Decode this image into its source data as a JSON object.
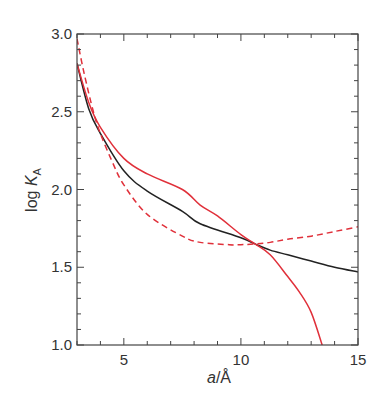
{
  "chart_data": {
    "type": "line",
    "title": "",
    "xlabel": "a/Å",
    "ylabel": "log K_A",
    "xlim": [
      3,
      15
    ],
    "ylim": [
      1.0,
      3.0
    ],
    "xticks": [
      5,
      10,
      15
    ],
    "yticks": [
      1.0,
      1.5,
      2.0,
      2.5,
      3.0
    ],
    "x_minor_step": 1,
    "y_minor_step": 0.1,
    "grid": false,
    "legend": null,
    "series": [
      {
        "name": "black solid",
        "color": "#222222",
        "dash": "solid",
        "x": [
          3.0,
          3.5,
          4.0,
          5.0,
          6.0,
          7.5,
          8.26,
          10.0,
          10.6,
          11.25,
          12.0,
          13.0,
          14.0,
          15.0
        ],
        "y": [
          2.81,
          2.52,
          2.36,
          2.12,
          1.99,
          1.86,
          1.78,
          1.69,
          1.65,
          1.61,
          1.58,
          1.54,
          1.5,
          1.47
        ]
      },
      {
        "name": "red solid",
        "color": "#e0303a",
        "dash": "solid",
        "x": [
          3.0,
          3.5,
          4.0,
          5.0,
          6.0,
          7.5,
          8.26,
          9.0,
          10.0,
          10.6,
          11.25,
          12.0,
          12.5,
          13.0,
          13.47
        ],
        "y": [
          2.81,
          2.56,
          2.4,
          2.2,
          2.1,
          2.0,
          1.9,
          1.83,
          1.71,
          1.65,
          1.58,
          1.44,
          1.34,
          1.21,
          1.0
        ]
      },
      {
        "name": "red dashed",
        "color": "#e0303a",
        "dash": "dashed",
        "x": [
          3.0,
          3.3,
          3.7,
          4.0,
          4.5,
          5.0,
          6.0,
          7.5,
          8.26,
          9.5,
          10.0,
          10.6,
          11.25,
          12.0,
          13.0,
          14.0,
          15.0
        ],
        "y": [
          2.97,
          2.75,
          2.5,
          2.36,
          2.18,
          2.03,
          1.84,
          1.7,
          1.66,
          1.645,
          1.645,
          1.65,
          1.66,
          1.68,
          1.7,
          1.73,
          1.76
        ]
      }
    ]
  },
  "labels": {
    "x_axis": {
      "italic": "a",
      "rest": "/Å"
    },
    "y_axis": {
      "log": "log ",
      "K": "K",
      "sub": "A"
    }
  }
}
